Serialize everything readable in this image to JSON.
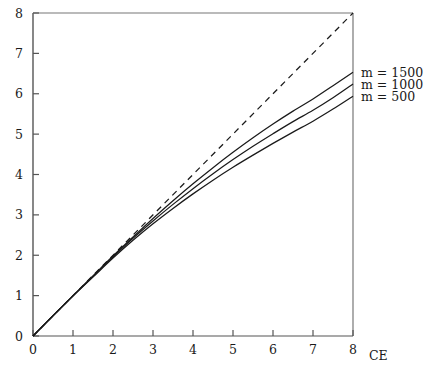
{
  "chart_data": {
    "type": "line",
    "title": "",
    "xlabel": "CE",
    "ylabel": "",
    "xlim": [
      0,
      8
    ],
    "ylim": [
      0,
      8
    ],
    "xticks": [
      0,
      1,
      2,
      3,
      4,
      5,
      6,
      7,
      8
    ],
    "yticks": [
      0,
      1,
      2,
      3,
      4,
      5,
      6,
      7,
      8
    ],
    "xtick_labels": [
      "0",
      "1",
      "2",
      "3",
      "4",
      "5",
      "6",
      "7",
      "8"
    ],
    "ytick_labels": [
      "0",
      "1",
      "2",
      "3",
      "4",
      "5",
      "6",
      "7",
      "8"
    ],
    "grid": false,
    "legend_position": "right-outside",
    "x": [
      0,
      0.5,
      1,
      1.5,
      2,
      2.5,
      3,
      3.5,
      4,
      4.5,
      5,
      5.5,
      6,
      6.5,
      7,
      7.5,
      8
    ],
    "series": [
      {
        "name": "reference",
        "label": "",
        "style": "dashed",
        "color": "#1a1a1a",
        "values": [
          0,
          0.5,
          1,
          1.5,
          2,
          2.5,
          3,
          3.5,
          4,
          4.5,
          5,
          5.5,
          6,
          6.5,
          7,
          7.5,
          8
        ]
      },
      {
        "name": "m1500",
        "label": "m = 1500",
        "style": "solid",
        "color": "#1a1a1a",
        "values": [
          0,
          0.5,
          1.0,
          1.49,
          1.98,
          2.45,
          2.91,
          3.35,
          3.77,
          4.17,
          4.55,
          4.91,
          5.25,
          5.57,
          5.87,
          6.2,
          6.53
        ]
      },
      {
        "name": "m1000",
        "label": "m = 1000",
        "style": "solid",
        "color": "#1a1a1a",
        "values": [
          0,
          0.5,
          0.995,
          1.48,
          1.96,
          2.42,
          2.85,
          3.26,
          3.65,
          4.02,
          4.37,
          4.7,
          5.01,
          5.31,
          5.59,
          5.9,
          6.24
        ]
      },
      {
        "name": "m500",
        "label": "m = 500",
        "style": "solid",
        "color": "#1a1a1a",
        "values": [
          0,
          0.5,
          0.99,
          1.46,
          1.93,
          2.37,
          2.78,
          3.16,
          3.52,
          3.86,
          4.18,
          4.48,
          4.77,
          5.05,
          5.32,
          5.62,
          5.94
        ]
      }
    ],
    "legend": [
      {
        "label": "m = 1500"
      },
      {
        "label": "m = 1000"
      },
      {
        "label": "m = 500"
      }
    ]
  },
  "axes": {
    "x_axis_label": "CE",
    "y_axis_label": ""
  },
  "colors": {
    "line": "#1a1a1a",
    "axis": "#4d4d4d",
    "background": "#ffffff"
  }
}
